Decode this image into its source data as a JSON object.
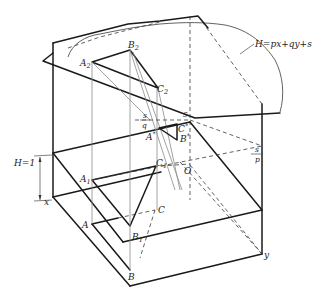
{
  "figure": {
    "title": "",
    "plane_equation": "H=px+qy+s",
    "height_label": "H=1",
    "axis_labels": {
      "x": "x",
      "y": "y"
    },
    "fractions": {
      "s_over_q": {
        "num": "s",
        "den": "q"
      },
      "s_over_p": {
        "num": "s",
        "den": "p"
      }
    },
    "points": {
      "A2": {
        "base": "A",
        "sub": "2"
      },
      "B2": {
        "base": "B",
        "sub": "2"
      },
      "C2": {
        "base": "C",
        "sub": "2"
      },
      "A1": {
        "base": "A",
        "sub": "1"
      },
      "B1": {
        "base": "B",
        "sub": "1"
      },
      "C1": {
        "base": "C",
        "sub": "1"
      },
      "A": {
        "base": "A"
      },
      "B": {
        "base": "B"
      },
      "C": {
        "base": "C"
      },
      "A_star": {
        "base": "A",
        "sup": "*"
      },
      "B_star": {
        "base": "B",
        "sup": "*"
      },
      "C_star": {
        "base": "C",
        "sup": "*"
      },
      "s": {
        "base": "s"
      },
      "O": {
        "base": "O"
      }
    }
  }
}
